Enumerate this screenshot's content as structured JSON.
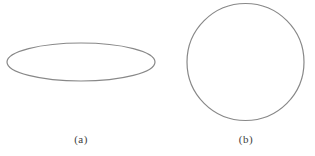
{
  "figure": {
    "background": "#ffffff",
    "stroke_color": "#888888",
    "stroke_width": 1.2,
    "label_color": "#3d3d3d",
    "shapes": [
      {
        "type": "ellipse",
        "cx": 81,
        "cy": 62,
        "rx": 74,
        "ry": 19,
        "label": "(a)"
      },
      {
        "type": "circle",
        "cx": 245.5,
        "cy": 62,
        "rx": 58.5,
        "ry": 58.5,
        "label": "(b)"
      }
    ]
  }
}
